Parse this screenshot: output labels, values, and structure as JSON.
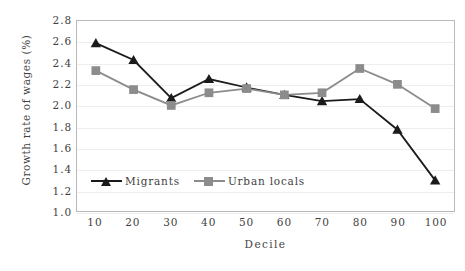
{
  "chart_data": {
    "type": "line",
    "title": "",
    "xlabel": "Decile",
    "ylabel": "Growth rate of wages (%)",
    "categories": [
      "10",
      "20",
      "30",
      "40",
      "50",
      "60",
      "70",
      "80",
      "90",
      "100"
    ],
    "x": [
      10,
      20,
      30,
      40,
      50,
      60,
      70,
      80,
      90,
      100
    ],
    "xlim": [
      5,
      105
    ],
    "ylim": [
      1.0,
      2.8
    ],
    "ytick_labels": [
      "2.8",
      "2.6",
      "2.4",
      "2.2",
      "2.0",
      "1.8",
      "1.6",
      "1.4",
      "1.2",
      "1.0"
    ],
    "ytick_values": [
      2.8,
      2.6,
      2.4,
      2.2,
      2.0,
      1.8,
      1.6,
      1.4,
      1.2,
      1.0
    ],
    "grid": true,
    "grid_axis": "y",
    "legend_position": "inside-bottom-left",
    "series": [
      {
        "name": "Migrants",
        "marker": "triangle",
        "color": "#1b1b1b",
        "values": [
          2.59,
          2.43,
          2.07,
          2.25,
          2.17,
          2.1,
          2.04,
          2.06,
          1.77,
          1.29
        ]
      },
      {
        "name": "Urban locals",
        "marker": "square",
        "color": "#8c8c8c",
        "values": [
          2.33,
          2.15,
          2.0,
          2.12,
          2.16,
          2.1,
          2.12,
          2.35,
          2.2,
          1.97
        ]
      }
    ]
  },
  "axes": {
    "frame_color": "#b9b9b9",
    "grid_color": "#eeeeee"
  },
  "legend": {
    "entries": [
      {
        "label": "Migrants",
        "marker": "triangle",
        "color": "#1b1b1b"
      },
      {
        "label": "Urban locals",
        "marker": "square",
        "color": "#8c8c8c"
      }
    ]
  }
}
